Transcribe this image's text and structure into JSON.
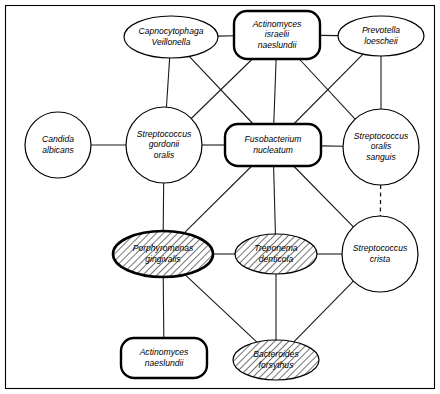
{
  "diagram": {
    "type": "network",
    "frame": {
      "visible": true,
      "color": "#000000"
    },
    "nodes": [
      {
        "id": "capnocytophaga",
        "name": "capnocytophaga-veillonella",
        "lines": [
          "Capnocytophaga",
          "Veillonella"
        ],
        "shape": "ellipse",
        "style": "thin",
        "hatched": false,
        "cx": 171,
        "cy": 37,
        "rx": 47,
        "ry": 21
      },
      {
        "id": "actinomyces-israelii",
        "name": "actinomyces-israelii-naeslundii",
        "lines": [
          "Actinomyces",
          "israelii",
          "naeslundii"
        ],
        "shape": "roundrect",
        "style": "bold",
        "hatched": false,
        "cx": 277,
        "cy": 35,
        "rx": 43,
        "ry": 24
      },
      {
        "id": "prevotella",
        "name": "prevotella-loescheii",
        "lines": [
          "Prevotella",
          "loescheii"
        ],
        "shape": "ellipse",
        "style": "thin",
        "hatched": false,
        "cx": 381,
        "cy": 36,
        "rx": 43,
        "ry": 20
      },
      {
        "id": "candida",
        "name": "candida-albicans",
        "lines": [
          "Candida",
          "albicans"
        ],
        "shape": "circle",
        "style": "thin",
        "hatched": false,
        "cx": 58,
        "cy": 145,
        "rx": 33,
        "ry": 33
      },
      {
        "id": "strep-gordonii",
        "name": "streptococcus-gordonii-oralis",
        "lines": [
          "Streptococcus",
          "gordonii",
          "oralis"
        ],
        "shape": "circle",
        "style": "thin",
        "hatched": false,
        "cx": 164,
        "cy": 145,
        "rx": 38,
        "ry": 38
      },
      {
        "id": "fusobacterium",
        "name": "fusobacterium-nucleatum",
        "lines": [
          "Fusobacterium",
          "nucleatum"
        ],
        "shape": "roundrect",
        "style": "bold",
        "hatched": false,
        "cx": 273,
        "cy": 145,
        "rx": 48,
        "ry": 21
      },
      {
        "id": "strep-oralis-sanguis",
        "name": "streptococcus-oralis-sanguis",
        "lines": [
          "Streptococcus",
          "oralis",
          "sanguis"
        ],
        "shape": "circle",
        "style": "thin",
        "hatched": false,
        "cx": 381,
        "cy": 147,
        "rx": 38,
        "ry": 38
      },
      {
        "id": "porphyromonas",
        "name": "porphyromonas-gingivalis",
        "lines": [
          "Porphyromonas",
          "gingivalis"
        ],
        "shape": "ellipse",
        "style": "bold",
        "hatched": true,
        "cx": 163,
        "cy": 254,
        "rx": 50,
        "ry": 23
      },
      {
        "id": "treponema",
        "name": "treponema-denticola",
        "lines": [
          "Treponema",
          "denticola"
        ],
        "shape": "ellipse",
        "style": "thin",
        "hatched": true,
        "cx": 276,
        "cy": 254,
        "rx": 41,
        "ry": 20
      },
      {
        "id": "strep-crista",
        "name": "streptococcus-crista",
        "lines": [
          "Streptococcus",
          "crista"
        ],
        "shape": "circle",
        "style": "thin",
        "hatched": false,
        "cx": 380,
        "cy": 254,
        "rx": 38,
        "ry": 38
      },
      {
        "id": "actinomyces-naeslundii",
        "name": "actinomyces-naeslundii",
        "lines": [
          "Actinomyces",
          "naeslundii"
        ],
        "shape": "roundrect",
        "style": "bold",
        "hatched": false,
        "cx": 164,
        "cy": 358,
        "rx": 43,
        "ry": 20
      },
      {
        "id": "bacteroides",
        "name": "bacteroides-forsythus",
        "lines": [
          "Bacteroides",
          "forsythus"
        ],
        "shape": "ellipse",
        "style": "thin",
        "hatched": true,
        "cx": 276,
        "cy": 360,
        "rx": 43,
        "ry": 20
      }
    ],
    "edges": [
      {
        "name": "edge-capnocytophaga-actinomyces-israelii",
        "from": "capnocytophaga",
        "to": "actinomyces-israelii",
        "style": "solid"
      },
      {
        "name": "edge-actinomyces-israelii-prevotella",
        "from": "actinomyces-israelii",
        "to": "prevotella",
        "style": "solid"
      },
      {
        "name": "edge-capnocytophaga-strep-gordonii",
        "from": "capnocytophaga",
        "to": "strep-gordonii",
        "style": "solid"
      },
      {
        "name": "edge-capnocytophaga-fusobacterium",
        "from": "capnocytophaga",
        "to": "fusobacterium",
        "style": "solid"
      },
      {
        "name": "edge-actinomyces-israelii-strep-gordonii",
        "from": "actinomyces-israelii",
        "to": "strep-gordonii",
        "style": "solid"
      },
      {
        "name": "edge-actinomyces-israelii-fusobacterium",
        "from": "actinomyces-israelii",
        "to": "fusobacterium",
        "style": "solid"
      },
      {
        "name": "edge-actinomyces-israelii-strep-oralis-sanguis",
        "from": "actinomyces-israelii",
        "to": "strep-oralis-sanguis",
        "style": "solid"
      },
      {
        "name": "edge-prevotella-fusobacterium",
        "from": "prevotella",
        "to": "fusobacterium",
        "style": "solid"
      },
      {
        "name": "edge-prevotella-strep-oralis-sanguis",
        "from": "prevotella",
        "to": "strep-oralis-sanguis",
        "style": "solid"
      },
      {
        "name": "edge-candida-strep-gordonii",
        "from": "candida",
        "to": "strep-gordonii",
        "style": "solid"
      },
      {
        "name": "edge-strep-gordonii-fusobacterium",
        "from": "strep-gordonii",
        "to": "fusobacterium",
        "style": "solid"
      },
      {
        "name": "edge-fusobacterium-strep-oralis-sanguis",
        "from": "fusobacterium",
        "to": "strep-oralis-sanguis",
        "style": "solid"
      },
      {
        "name": "edge-strep-gordonii-porphyromonas",
        "from": "strep-gordonii",
        "to": "porphyromonas",
        "style": "solid"
      },
      {
        "name": "edge-fusobacterium-porphyromonas",
        "from": "fusobacterium",
        "to": "porphyromonas",
        "style": "solid"
      },
      {
        "name": "edge-fusobacterium-treponema",
        "from": "fusobacterium",
        "to": "treponema",
        "style": "solid"
      },
      {
        "name": "edge-fusobacterium-strep-crista",
        "from": "fusobacterium",
        "to": "strep-crista",
        "style": "solid"
      },
      {
        "name": "edge-strep-oralis-sanguis-strep-crista",
        "from": "strep-oralis-sanguis",
        "to": "strep-crista",
        "style": "dashed"
      },
      {
        "name": "edge-porphyromonas-treponema",
        "from": "porphyromonas",
        "to": "treponema",
        "style": "solid"
      },
      {
        "name": "edge-treponema-strep-crista",
        "from": "treponema",
        "to": "strep-crista",
        "style": "solid"
      },
      {
        "name": "edge-porphyromonas-actinomyces-naeslundii",
        "from": "porphyromonas",
        "to": "actinomyces-naeslundii",
        "style": "solid"
      },
      {
        "name": "edge-porphyromonas-bacteroides",
        "from": "porphyromonas",
        "to": "bacteroides",
        "style": "solid"
      },
      {
        "name": "edge-treponema-bacteroides",
        "from": "treponema",
        "to": "bacteroides",
        "style": "solid"
      },
      {
        "name": "edge-strep-crista-bacteroides",
        "from": "strep-crista",
        "to": "bacteroides",
        "style": "solid"
      }
    ]
  }
}
